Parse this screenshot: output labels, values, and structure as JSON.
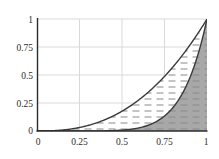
{
  "chart_data": {
    "type": "line",
    "title": "",
    "xlabel": "",
    "ylabel": "",
    "xlim": [
      0,
      1
    ],
    "ylim": [
      0,
      1
    ],
    "grid": true,
    "legend": "none",
    "xticks": [
      "0",
      "0.25",
      "0.5",
      "0.75",
      "1"
    ],
    "xtick_values": [
      0,
      0.25,
      0.5,
      0.75,
      1
    ],
    "yticks": [
      "0",
      "0.25",
      "0.5",
      "0.75",
      "1"
    ],
    "ytick_values": [
      0,
      0.25,
      0.5,
      0.75,
      1
    ],
    "series": [
      {
        "name": "upper-curve",
        "exponent": 2.5,
        "x": [
          0,
          0.05,
          0.1,
          0.15,
          0.2,
          0.25,
          0.3,
          0.35,
          0.4,
          0.45,
          0.5,
          0.55,
          0.6,
          0.65,
          0.7,
          0.75,
          0.8,
          0.85,
          0.9,
          0.95,
          1
        ],
        "values": [
          0,
          0.001,
          0.003,
          0.009,
          0.018,
          0.031,
          0.049,
          0.072,
          0.101,
          0.136,
          0.177,
          0.224,
          0.279,
          0.341,
          0.41,
          0.487,
          0.573,
          0.666,
          0.769,
          0.88,
          1
        ]
      },
      {
        "name": "lower-curve",
        "exponent": 7,
        "x": [
          0,
          0.1,
          0.2,
          0.3,
          0.4,
          0.45,
          0.5,
          0.55,
          0.6,
          0.65,
          0.7,
          0.75,
          0.8,
          0.85,
          0.9,
          0.95,
          0.975,
          1
        ],
        "values": [
          0,
          1e-07,
          1.28e-05,
          0.0002187,
          0.0016384,
          0.0037367,
          0.0078125,
          0.0152244,
          0.0279936,
          0.049022,
          0.0823543,
          0.1334839,
          0.2097152,
          0.3205771,
          0.4782969,
          0.6983373,
          0.8395,
          1
        ]
      }
    ],
    "regions": [
      {
        "name": "hatched-region-between-curves",
        "fill": "#ffffff",
        "pattern": "horizontal-dashes",
        "pattern_color": "#8a8a8a"
      },
      {
        "name": "shaded-region-below-lower-curve",
        "fill": "#a8a8a8",
        "pattern": "horizontal-dashes",
        "pattern_color": "#8a8a8a"
      }
    ],
    "colors": {
      "curve": "#3a3a3a",
      "axis": "#2b2b2b",
      "grid": "#d9d9d9",
      "shade": "#a8a8a8",
      "hatch": "#8a8a8a",
      "background": "#ffffff"
    }
  },
  "geometry": {
    "left": 37,
    "right": 207,
    "top": 19,
    "bottom": 131
  }
}
